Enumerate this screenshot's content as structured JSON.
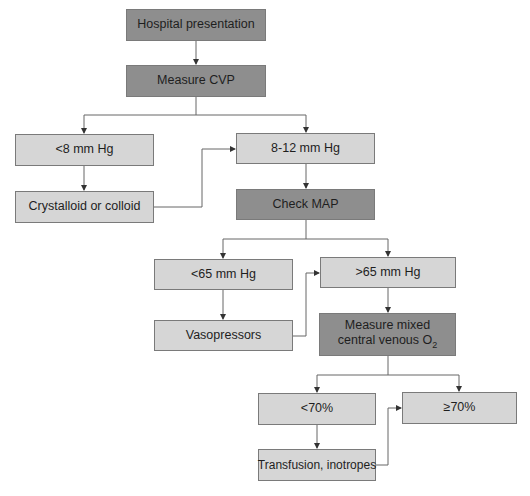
{
  "colors": {
    "light_box": "#d6d6d6",
    "dark_box": "#8e8e8e",
    "line": "#555555"
  },
  "nodes": {
    "hospital": {
      "label": "Hospital presentation"
    },
    "cvp": {
      "label": "Measure CVP"
    },
    "cvp_low": {
      "label": "<8 mm Hg"
    },
    "fluids": {
      "label": "Crystalloid or colloid"
    },
    "cvp_ok": {
      "label": "8-12 mm Hg"
    },
    "map": {
      "label": "Check MAP"
    },
    "map_low": {
      "label": "<65 mm Hg"
    },
    "vaso": {
      "label": "Vasopressors"
    },
    "map_ok": {
      "label": ">65 mm Hg"
    },
    "svo2": {
      "label_line1": "Measure mixed",
      "label_line2": "central venous O",
      "label_sub": "2"
    },
    "svo2_low": {
      "label": "<70%"
    },
    "transfusion": {
      "label": "Transfusion, inotropes"
    },
    "svo2_ok": {
      "label": "≥70%"
    }
  }
}
